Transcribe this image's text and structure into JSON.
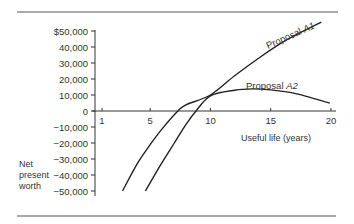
{
  "chart_data": {
    "type": "line",
    "title": "",
    "xlabel": "Useful life (years)",
    "ylabel": "Net present worth",
    "x_ticks": [
      1,
      5,
      10,
      15,
      20
    ],
    "x_tick_labels": [
      "1",
      "5",
      "10",
      "15",
      "20"
    ],
    "y_ticks": [
      50000,
      40000,
      30000,
      20000,
      10000,
      0,
      -10000,
      -20000,
      -30000,
      -40000,
      -50000
    ],
    "y_tick_labels": [
      "$50,000",
      "40,000",
      "30,000",
      "20,000",
      "10,000",
      "0",
      "−10,000",
      "−20,000",
      "−30,000",
      "−40,000",
      "−50,000"
    ],
    "xlim": [
      1,
      20
    ],
    "ylim": [
      -50000,
      55000
    ],
    "grid": false,
    "legend": "inline labels on curves",
    "series": [
      {
        "name": "Proposal A1",
        "x": [
          2.7,
          4,
          5,
          6,
          7.3,
          8,
          10,
          12,
          14,
          16,
          18,
          19.2
        ],
        "values": [
          -50000,
          -32000,
          -21000,
          -11000,
          0,
          4000,
          10000,
          22000,
          33000,
          43000,
          51000,
          55500
        ]
      },
      {
        "name": "Proposal A2",
        "x": [
          4.6,
          6,
          7,
          8,
          8.8,
          10,
          12,
          13.5,
          15,
          17,
          19.9
        ],
        "values": [
          -50000,
          -32000,
          -20000,
          -8000,
          0,
          9500,
          13000,
          13800,
          13200,
          11000,
          5000
        ]
      }
    ]
  },
  "labels": {
    "ylabel_lines": [
      "Net",
      "present",
      "worth"
    ],
    "xlabel": "Useful life (years)",
    "series_a1": "Proposal A1",
    "series_a2": "Proposal A2",
    "series_a1_prefix": "Proposal ",
    "series_a1_id": "A1",
    "series_a2_prefix": "Proposal ",
    "series_a2_id": "A2"
  },
  "colors": {
    "ink": "#222222",
    "rule": "#555555"
  }
}
